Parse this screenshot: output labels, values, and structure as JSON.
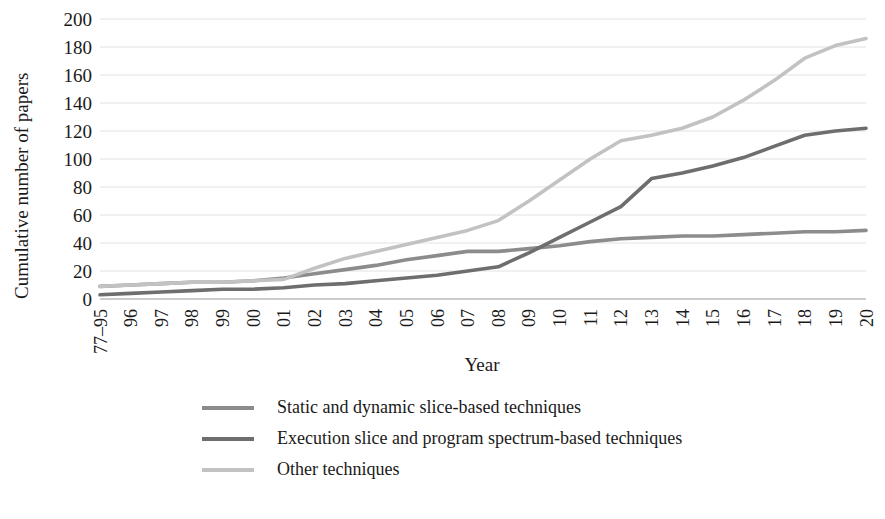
{
  "chart_data": {
    "type": "line",
    "title": "",
    "xlabel": "Year",
    "ylabel": "Cumulative number of papers",
    "ylim": [
      0,
      200
    ],
    "ytick_step": 20,
    "yticks": [
      0,
      20,
      40,
      60,
      80,
      100,
      120,
      140,
      160,
      180,
      200
    ],
    "grid": true,
    "legend_position": "bottom",
    "categories": [
      "77–95",
      "96",
      "97",
      "98",
      "99",
      "00",
      "01",
      "02",
      "03",
      "04",
      "05",
      "06",
      "07",
      "08",
      "09",
      "10",
      "11",
      "12",
      "13",
      "14",
      "15",
      "16",
      "17",
      "18",
      "19",
      "20"
    ],
    "series": [
      {
        "name": "Static and dynamic slice-based techniques",
        "color": "#8c8c8c",
        "values": [
          9,
          10,
          11,
          12,
          12,
          13,
          15,
          18,
          21,
          24,
          28,
          31,
          34,
          34,
          36,
          38,
          41,
          43,
          44,
          45,
          45,
          46,
          47,
          48,
          48,
          49
        ]
      },
      {
        "name": "Execution slice and program spectrum-based techniques",
        "color": "#6e6e6e",
        "values": [
          3,
          4,
          5,
          6,
          7,
          7,
          8,
          10,
          11,
          13,
          15,
          17,
          20,
          23,
          33,
          44,
          55,
          66,
          86,
          90,
          95,
          101,
          109,
          117,
          120,
          122
        ]
      },
      {
        "name": "Other techniques",
        "color": "#c2c2c2",
        "values": [
          9,
          10,
          11,
          12,
          12,
          13,
          14,
          22,
          29,
          34,
          39,
          44,
          49,
          56,
          70,
          85,
          100,
          113,
          117,
          122,
          130,
          142,
          156,
          172,
          181,
          186
        ]
      }
    ]
  },
  "axes": {
    "y_axis_label": "Cumulative number of papers",
    "x_axis_label": "Year"
  },
  "legend": {
    "items": [
      {
        "label": "Static and dynamic slice-based techniques",
        "color": "#8c8c8c"
      },
      {
        "label": "Execution slice and program spectrum-based techniques",
        "color": "#6e6e6e"
      },
      {
        "label": "Other techniques",
        "color": "#c2c2c2"
      }
    ]
  },
  "colors": {
    "gridline": "#e2e2e2",
    "axis": "#9a9a9a",
    "text": "#1a1a1a",
    "background": "#ffffff"
  }
}
